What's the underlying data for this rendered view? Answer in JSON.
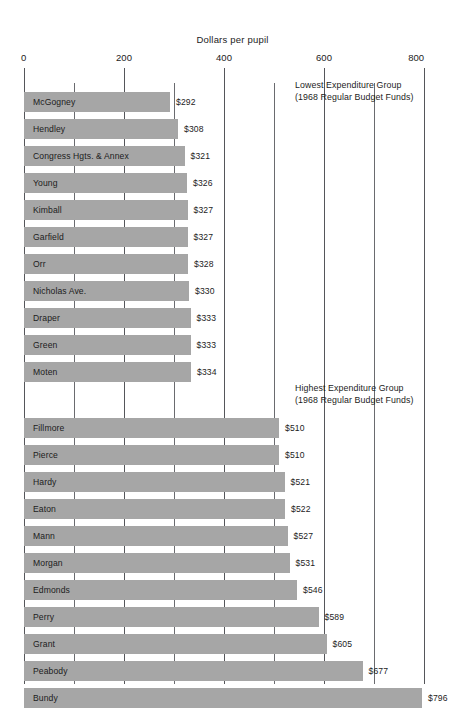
{
  "chart_data": {
    "type": "bar",
    "orientation": "horizontal",
    "title": "Dollars per pupil",
    "xlabel": "",
    "ylabel": "",
    "xlim": [
      0,
      800
    ],
    "grid": true,
    "gridline_values": [
      0,
      100,
      200,
      300,
      400,
      500,
      600,
      700,
      800
    ],
    "tick_labels": [
      "0",
      "200",
      "400",
      "600",
      "800"
    ],
    "tick_values": [
      0,
      200,
      400,
      600,
      800
    ],
    "legend_position": "none",
    "annotations": [
      {
        "id": "lowest-group-note",
        "line1": "Lowest Expenditure Group",
        "line2": "(1968 Regular Budget Funds)"
      },
      {
        "id": "highest-group-note",
        "line1": "Highest Expenditure Group",
        "line2": "(1968 Regular Budget Funds)"
      }
    ],
    "groups": [
      {
        "name": "Lowest Expenditure Group",
        "categories": [
          "McGogney",
          "Hendley",
          "Congress Hgts. & Annex",
          "Young",
          "Kimball",
          "Garfield",
          "Orr",
          "Nicholas Ave.",
          "Draper",
          "Green",
          "Moten"
        ],
        "values": [
          292,
          308,
          321,
          326,
          327,
          327,
          328,
          330,
          333,
          333,
          334
        ],
        "value_labels": [
          "$292",
          "$308",
          "$321",
          "$326",
          "$327",
          "$327",
          "$328",
          "$330",
          "$333",
          "$333",
          "$334"
        ]
      },
      {
        "name": "Highest Expenditure Group",
        "categories": [
          "Fillmore",
          "Pierce",
          "Hardy",
          "Eaton",
          "Mann",
          "Morgan",
          "Edmonds",
          "Perry",
          "Grant",
          "Peabody",
          "Bundy"
        ],
        "values": [
          510,
          510,
          521,
          522,
          527,
          531,
          546,
          589,
          605,
          677,
          796
        ],
        "value_labels": [
          "$510",
          "$510",
          "$521",
          "$522",
          "$527",
          "$531",
          "$546",
          "$589",
          "$605",
          "$677",
          "$796"
        ]
      }
    ]
  },
  "colors": {
    "bar": "#a6a6a6",
    "gridline": "#55565a",
    "text": "#1c1c1c",
    "background": "#ffffff"
  }
}
